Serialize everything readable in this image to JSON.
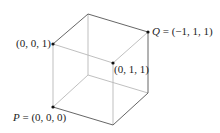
{
  "diagram": {
    "type": "cube",
    "labels": {
      "p": {
        "name": "P",
        "eq": " = (0, 0, 0)"
      },
      "q": {
        "name": "Q",
        "eq": " = (−1, 1, 1)"
      },
      "v001": "(0, 0, 1)",
      "v011": "(0, 1, 1)"
    },
    "colors": {
      "edge": "#555555",
      "edge_light": "#b8b8b8",
      "vertex": "#111111",
      "text": "#222222"
    }
  }
}
